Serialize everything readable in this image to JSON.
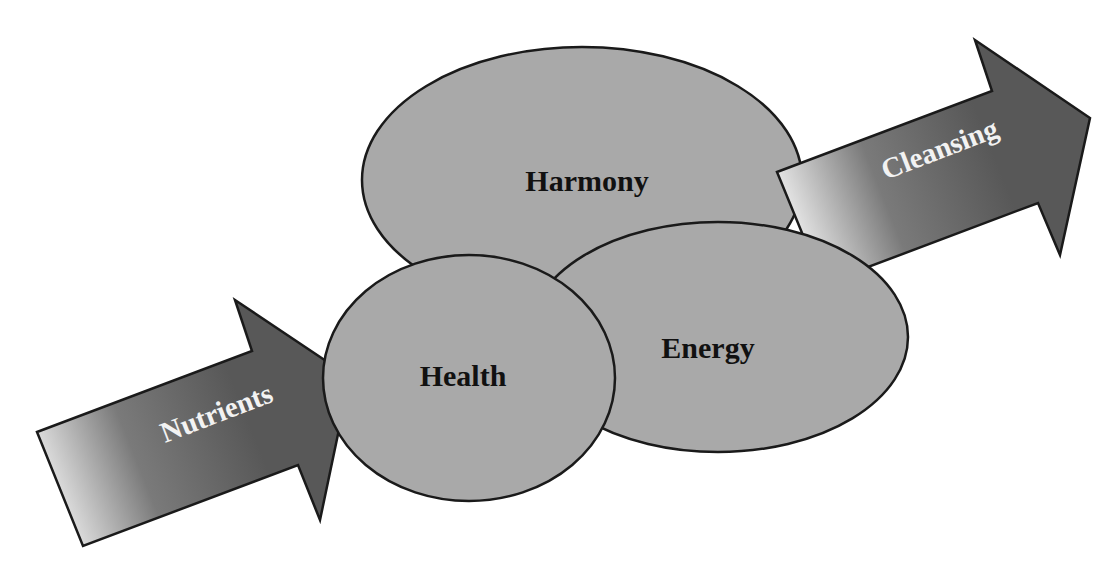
{
  "diagram": {
    "type": "overlapping-ellipses-with-flow-arrows",
    "colors": {
      "background": "#ffffff",
      "ellipse_fill": "#a9a9a9",
      "outline": "#1a1a1a",
      "arrow_dark": "#5a5a5a",
      "arrow_light": "#e6e6e6",
      "ellipse_text": "#111111",
      "arrow_text": "#f2f2f2"
    },
    "ellipses": [
      {
        "id": "harmony",
        "label": "Harmony"
      },
      {
        "id": "energy",
        "label": "Energy"
      },
      {
        "id": "health",
        "label": "Health"
      }
    ],
    "arrows": [
      {
        "id": "nutrients",
        "label": "Nutrients",
        "direction": "in"
      },
      {
        "id": "cleansing",
        "label": "Cleansing",
        "direction": "out"
      }
    ]
  }
}
